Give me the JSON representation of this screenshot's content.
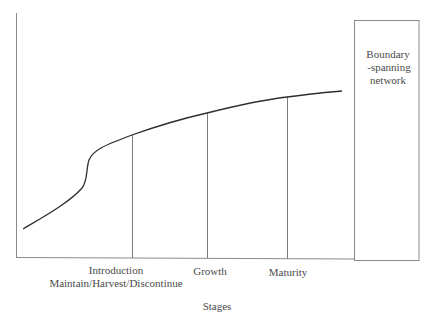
{
  "diagram": {
    "type": "lifecycle-curve",
    "axis_title": "Stages",
    "stage_labels": [
      {
        "line1": "Introduction",
        "line2": "Maintain/Harvest/Discontinue"
      },
      {
        "line1": "Growth"
      },
      {
        "line1": "Maturity"
      }
    ],
    "box": {
      "lines": [
        "Boundary",
        "-spanning",
        "network"
      ]
    },
    "colors": {
      "curve": "#2e2e2e",
      "axes": "#8a8a8a",
      "text": "#4a4a4a",
      "background": "#ffffff"
    }
  }
}
